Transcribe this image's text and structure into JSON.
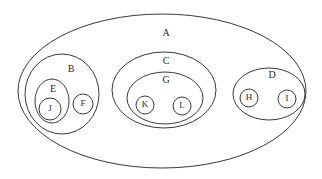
{
  "diagram": {
    "type": "nested-set-diagram",
    "nodes": {
      "A": {
        "label": "A",
        "parent": null
      },
      "B": {
        "label": "B",
        "parent": "A"
      },
      "C": {
        "label": "C",
        "parent": "A"
      },
      "D": {
        "label": "D",
        "parent": "A"
      },
      "E": {
        "label": "E",
        "parent": "B"
      },
      "F": {
        "label": "F",
        "parent": "B"
      },
      "J": {
        "label": "J",
        "parent": "E"
      },
      "G": {
        "label": "G",
        "parent": "C"
      },
      "K": {
        "label": "K",
        "parent": "G"
      },
      "L": {
        "label": "L",
        "parent": "G"
      },
      "H": {
        "label": "H",
        "parent": "D"
      },
      "I": {
        "label": "I",
        "parent": "D"
      }
    },
    "stroke_color": "#3a3a3a",
    "background": "#ffffff"
  }
}
